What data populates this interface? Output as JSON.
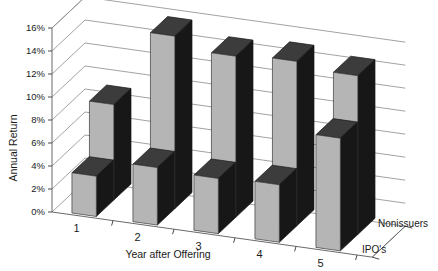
{
  "chart_data": {
    "type": "bar",
    "title": "",
    "subtitle": "",
    "xlabel": "Year after Offering",
    "ylabel": "Annual Return",
    "categories": [
      "1",
      "2",
      "3",
      "4",
      "5"
    ],
    "ylim": [
      0,
      16
    ],
    "ytick_labels": [
      "0%",
      "2%",
      "4%",
      "6%",
      "8%",
      "10%",
      "12%",
      "14%",
      "16%"
    ],
    "ytick_values": [
      0,
      2,
      4,
      6,
      8,
      10,
      12,
      14,
      16
    ],
    "grid": true,
    "legend_position": "depth-axis-right",
    "three_d": true,
    "series": [
      {
        "name": "IPO's",
        "values": [
          3.5,
          5.0,
          4.8,
          5.0,
          9.8
        ]
      },
      {
        "name": "Nonissuers",
        "values": [
          8.3,
          15.0,
          14.0,
          14.3,
          13.8
        ]
      }
    ],
    "legend_entries": [
      "Nonissuers",
      "IPO's"
    ],
    "colors": {
      "bar_front": "#b5b5b5",
      "bar_side": "#171717",
      "bar_top": "#3c3c3c",
      "grid": "#8a8a8a",
      "text": "#1a1a1a"
    }
  },
  "axes": {
    "y_title": "Annual Return",
    "x_title": "Year after Offering",
    "y_ticks": [
      {
        "label": "16%"
      },
      {
        "label": "14%"
      },
      {
        "label": "12%"
      },
      {
        "label": "10%"
      },
      {
        "label": "8%"
      },
      {
        "label": "6%"
      },
      {
        "label": "4%"
      },
      {
        "label": "2%"
      },
      {
        "label": "0%"
      }
    ],
    "x_ticks": [
      {
        "label": "1"
      },
      {
        "label": "2"
      },
      {
        "label": "3"
      },
      {
        "label": "4"
      },
      {
        "label": "5"
      }
    ]
  },
  "depth_axis": {
    "back_label": "Nonissuers",
    "front_label": "IPO's"
  }
}
